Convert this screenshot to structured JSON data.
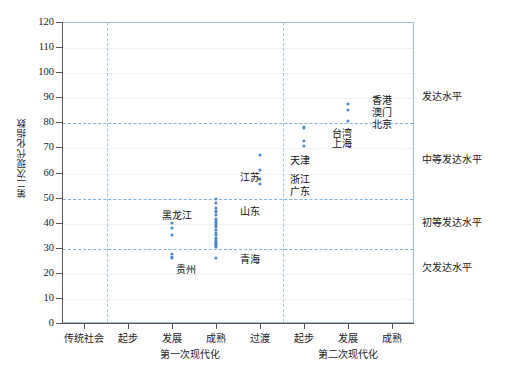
{
  "chart_data": {
    "type": "scatter",
    "title": "",
    "xlabel": "",
    "ylabel": "第二次现代化指数",
    "ylim": [
      0,
      120
    ],
    "ytick_values": [
      0,
      10,
      20,
      30,
      40,
      50,
      60,
      70,
      80,
      90,
      100,
      110,
      120
    ],
    "ytick_labels": [
      "0",
      "10",
      "20",
      "30",
      "40",
      "50",
      "60",
      "70",
      "80",
      "90",
      "100",
      "110",
      "120"
    ],
    "grid": true,
    "legend": "none",
    "x_categories": [
      {
        "label": "传统社会",
        "group": "第一次现代化"
      },
      {
        "label": "起步",
        "group": "第一次现代化"
      },
      {
        "label": "发展",
        "group": "第一次现代化"
      },
      {
        "label": "成熟",
        "group": "第一次现代化"
      },
      {
        "label": "过渡",
        "group": "第一次现代化"
      },
      {
        "label": "起步",
        "group": "第二次现代化"
      },
      {
        "label": "发展",
        "group": "第二次现代化"
      },
      {
        "label": "成熟",
        "group": "第二次现代化"
      }
    ],
    "x_groups": [
      "第一次现代化",
      "第二次现代化"
    ],
    "level_lines": [
      {
        "value": 80,
        "label": "发达水平",
        "label_at": 90
      },
      {
        "value": 50,
        "label": "中等发达水平",
        "label_at": 65
      },
      {
        "value": 30,
        "label": "初等发达水平",
        "label_at": 40
      },
      {
        "value": 0,
        "label": "欠发达水平",
        "label_at": 22
      }
    ],
    "vertical_dividers": [
      "传统社会/起步",
      "过渡/起步"
    ],
    "series": [
      {
        "name": "第一次现代化 发展",
        "category": "发展",
        "group": "第一次现代化",
        "values": [
          40,
          38,
          35,
          27.5,
          26.5,
          26
        ]
      },
      {
        "name": "第一次现代化 成熟",
        "category": "成熟",
        "group": "第一次现代化",
        "values": [
          49.5,
          48,
          46,
          44.5,
          43,
          41.5,
          40.5,
          39.5,
          38.5,
          37,
          36,
          35,
          34,
          33.5,
          32.5,
          32,
          31.5,
          31,
          30.5,
          26
        ]
      },
      {
        "name": "第一次现代化 过渡",
        "category": "过渡",
        "group": "第一次现代化",
        "values": [
          67,
          61,
          57.5,
          55.5
        ]
      },
      {
        "name": "第二次现代化 起步",
        "category": "起步",
        "group": "第二次现代化",
        "values": [
          78,
          72.5,
          70.5
        ]
      },
      {
        "name": "第二次现代化 发展",
        "category": "发展",
        "group": "第二次现代化",
        "values": [
          87.5,
          85,
          80.5
        ]
      }
    ],
    "annotations": [
      {
        "text": "香港",
        "value": 87.5,
        "category": "发展",
        "group": "第二次现代化"
      },
      {
        "text": "澳门",
        "value": 85,
        "category": "发展",
        "group": "第二次现代化"
      },
      {
        "text": "北京",
        "value": 80.5,
        "category": "发展",
        "group": "第二次现代化"
      },
      {
        "text": "台湾",
        "value": 72.5,
        "category": "起步",
        "group": "第二次现代化"
      },
      {
        "text": "上海",
        "value": 70.5,
        "category": "起步",
        "group": "第二次现代化"
      },
      {
        "text": "天津",
        "value": 67,
        "category": "过渡",
        "group": "第一次现代化"
      },
      {
        "text": "浙江",
        "value": 61,
        "category": "过渡",
        "group": "第一次现代化"
      },
      {
        "text": "广东",
        "value": 57.5,
        "category": "过渡",
        "group": "第一次现代化"
      },
      {
        "text": "江苏",
        "value": 61,
        "category": "成熟",
        "group": "第一次现代化"
      },
      {
        "text": "山东",
        "value": 46,
        "category": "成熟",
        "group": "第一次现代化"
      },
      {
        "text": "黑龙江",
        "value": 40,
        "category": "发展",
        "group": "第一次现代化"
      },
      {
        "text": "贵州",
        "value": 26,
        "category": "发展",
        "group": "第一次现代化"
      },
      {
        "text": "青海",
        "value": 26,
        "category": "成熟",
        "group": "第一次现代化"
      }
    ]
  },
  "axis": {
    "y_title": "第二次现代化指数"
  },
  "ticks": {
    "y": [
      "120",
      "110",
      "100",
      "90",
      "80",
      "70",
      "60",
      "50",
      "40",
      "30",
      "20",
      "10",
      "0"
    ],
    "x": [
      "传统社会",
      "起步",
      "发展",
      "成熟",
      "过渡",
      "起步",
      "发展",
      "成熟"
    ]
  },
  "groups": {
    "first": "第一次现代化",
    "second": "第二次现代化"
  },
  "levels": {
    "developed": "发达水平",
    "moderate": "中等发达水平",
    "primary": "初等发达水平",
    "under": "欠发达水平"
  },
  "points": {
    "hongkong": "香港",
    "macau": "澳门",
    "beijing": "北京",
    "taiwan": "台湾",
    "shanghai": "上海",
    "tianjin": "天津",
    "zhejiang": "浙江",
    "guangdong": "广东",
    "jiangsu": "江苏",
    "shandong": "山东",
    "heilongjiang": "黑龙江",
    "guizhou": "贵州",
    "qinghai": "青海"
  },
  "colors": {
    "marker": "#4a86c8",
    "level_line": "#7fb2dd",
    "grid": "#f0f0f0",
    "frame": "#9fb9d0",
    "axis": "#555555"
  }
}
